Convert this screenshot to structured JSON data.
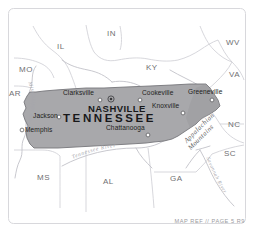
{
  "map": {
    "title_state": "TENNESSEE",
    "frame_color": "#d8d8dc",
    "state_fill": "#a8a8ab",
    "state_stroke": "#7b7b7f",
    "background": "#ffffff",
    "neighbor_fill": "#ffffff",
    "border_line_color": "#c9c9cf",
    "river_color": "#c0c0c6",
    "capital": {
      "name": "NASHVILLE",
      "marker": "capital-star-marker"
    },
    "cities": [
      {
        "name": "Clarksville",
        "x": 63,
        "y": 93,
        "dot_x": 100,
        "dot_y": 100
      },
      {
        "name": "Jackson",
        "x": 33,
        "y": 111,
        "dot_x": 59,
        "dot_y": 117
      },
      {
        "name": "Memphis",
        "x": 25,
        "y": 129,
        "dot_x": 22,
        "dot_y": 130
      },
      {
        "name": "Cookeville",
        "x": 143,
        "y": 93,
        "dot_x": 140,
        "dot_y": 100
      },
      {
        "name": "Knoxville",
        "x": 155,
        "y": 106,
        "dot_x": 183,
        "dot_y": 113
      },
      {
        "name": "Greeneville",
        "x": 191,
        "y": 91,
        "dot_x": 212,
        "dot_y": 100
      },
      {
        "name": "Chattanooga",
        "x": 107,
        "y": 127,
        "dot_x": 148,
        "dot_y": 135
      }
    ],
    "neighbor_states": [
      {
        "abbr": "IL",
        "x": 59,
        "y": 44
      },
      {
        "abbr": "IN",
        "x": 109,
        "y": 31
      },
      {
        "abbr": "MO",
        "x": 20,
        "y": 68
      },
      {
        "abbr": "KY",
        "x": 148,
        "y": 66
      },
      {
        "abbr": "WV",
        "x": 229,
        "y": 41
      },
      {
        "abbr": "VA",
        "x": 232,
        "y": 73
      },
      {
        "abbr": "AR",
        "x": 8,
        "y": 92
      },
      {
        "abbr": "NC",
        "x": 230,
        "y": 123
      },
      {
        "abbr": "SC",
        "x": 226,
        "y": 152
      },
      {
        "abbr": "MS",
        "x": 38,
        "y": 176
      },
      {
        "abbr": "AL",
        "x": 104,
        "y": 180
      },
      {
        "abbr": "GA",
        "x": 171,
        "y": 177
      }
    ],
    "rivers": [
      {
        "name": "Mississippi River"
      },
      {
        "name": "Tennessee River"
      },
      {
        "name": "Savannah River"
      }
    ],
    "mountain_range": {
      "line1": "Appalachian",
      "line2": "Mountains"
    },
    "footer_reference": "MAP REF // PAGE 5 R9"
  }
}
